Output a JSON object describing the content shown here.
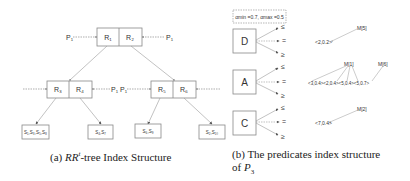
{
  "panel_a": {
    "caption_prefix": "(a) ",
    "caption_rr": "RR",
    "caption_sup": "t",
    "caption_rest": "-tree Index Structure",
    "root": {
      "left": "R₁",
      "right": "R₂",
      "pointer_left": "P₁",
      "pointer_right": "P₁"
    },
    "left_node": {
      "left": "R₃",
      "right": "R₄",
      "pointer_right": "P₁"
    },
    "right_node": {
      "left": "R₅",
      "right": "R₆",
      "pointer_left": "P₁"
    },
    "leaves": [
      "S₁,S₃,S₅,S₈",
      "S₄,S₇",
      "S₆,S₉",
      "S₂,S₁₀"
    ]
  },
  "panel_b": {
    "caption_line1": "(b) The predicates index structure",
    "caption_line2_prefix": "of ",
    "caption_line2_var": "P",
    "caption_line2_sub": "3",
    "alpha_box": "αmin =0.7, αmax =0.5",
    "attributes": [
      {
        "name": "D",
        "ops": [
          "≤",
          "=",
          "≥"
        ]
      },
      {
        "name": "A",
        "ops": [
          "≤",
          "=",
          "≥"
        ]
      },
      {
        "name": "C",
        "ops": [
          "≤",
          "=",
          "≥"
        ]
      }
    ],
    "d_tree": {
      "label": "M[5]",
      "value": "<2,0.2>"
    },
    "a_tree": {
      "label1": "M[1]",
      "label2": "M[6]",
      "values": "<3,0.4><2,0.4><5,0.4><5,0.7>"
    },
    "c_tree": {
      "label": "M[2]",
      "value": "<7,0.4>"
    }
  }
}
